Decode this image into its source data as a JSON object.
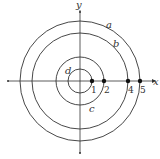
{
  "diagram": {
    "type": "concentric-circles",
    "axes": {
      "x_label": "x",
      "y_label": "y"
    },
    "circles": [
      {
        "label": "a",
        "radius": 5
      },
      {
        "label": "b",
        "radius": 4
      },
      {
        "label": "c",
        "radius": 2
      },
      {
        "label": "d",
        "radius": 1
      }
    ],
    "points": [
      {
        "label": "1",
        "x": 1
      },
      {
        "label": "2",
        "x": 2
      },
      {
        "label": "4",
        "x": 4
      },
      {
        "label": "5",
        "x": 5
      }
    ],
    "colors": {
      "stroke": "#333333",
      "background": "#ffffff"
    }
  }
}
